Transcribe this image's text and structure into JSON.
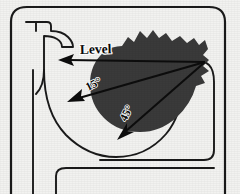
{
  "figure": {
    "background_color": "#f2f2f0",
    "outline_color": "#1a1a1a",
    "blob_color": "#3a3a3a",
    "arrow_color": "#0d0d0d"
  },
  "labels": {
    "level": "Level",
    "angle_upper": "15°",
    "angle_lower": "45°"
  },
  "vectors": [
    {
      "name": "level-vector",
      "label": "Level",
      "origin": [
        205,
        62
      ],
      "tip": [
        60,
        60
      ],
      "angle_degrees": 0
    },
    {
      "name": "fifteen-degree-vector",
      "label": "15°",
      "origin": [
        205,
        62
      ],
      "tip": [
        70,
        101
      ],
      "angle_degrees": 15
    },
    {
      "name": "forty-five-degree-vector",
      "label": "45°",
      "origin": [
        205,
        62
      ],
      "tip": [
        120,
        138
      ],
      "angle_degrees": 45
    }
  ],
  "parts": [
    {
      "name": "toilet-body-outline"
    },
    {
      "name": "rim-inlet-pipe"
    },
    {
      "name": "bowl-basin-curve"
    },
    {
      "name": "trapway-outline"
    },
    {
      "name": "pedestal-base"
    },
    {
      "name": "water-pool-blob"
    }
  ]
}
